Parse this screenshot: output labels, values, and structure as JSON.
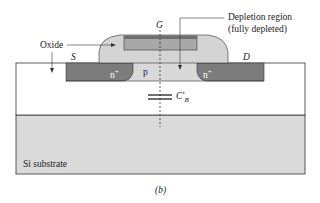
{
  "diagram": {
    "type": "cross-section",
    "caption": "(b)",
    "labels": {
      "gate": "G",
      "source": "S",
      "drain": "D",
      "oxide": "Oxide",
      "depletion": "Depletion region",
      "depletion_note": "(fully depleted)",
      "n_plus_left": "n",
      "n_plus_right": "n",
      "plus_sup": "+",
      "p_region": "p",
      "capacitor_main": "C",
      "capacitor_sub": "B",
      "capacitor_prime": "′",
      "substrate": "Si substrate"
    },
    "colors": {
      "n_plus": "#7c7c7c",
      "oxide": "#d4d4d4",
      "gate": "#a8a8a8",
      "gate_top": "#6e6e6e",
      "p_region": "#d9d9d9",
      "buried_oxide": "#ffffff",
      "substrate": "#dadada",
      "outline": "#333333"
    }
  }
}
